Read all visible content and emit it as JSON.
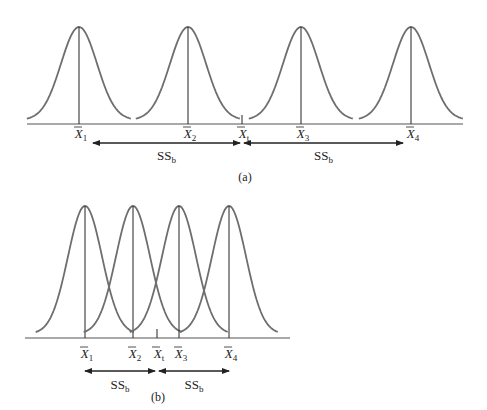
{
  "colors": {
    "curve": "#6e6e6e",
    "ink": "#222222",
    "background": "#ffffff"
  },
  "panel_a": {
    "caption": "(a)",
    "baseline_y": 124,
    "peak_y": 27,
    "x_start": 27,
    "x_end": 463,
    "sigma": 18,
    "means": [
      {
        "id": "X1",
        "symbol": "X",
        "sub": "1",
        "x": 79
      },
      {
        "id": "X2",
        "symbol": "X",
        "sub": "2",
        "x": 188
      },
      {
        "id": "X3",
        "symbol": "X",
        "sub": "3",
        "x": 301
      },
      {
        "id": "X4",
        "symbol": "X",
        "sub": "4",
        "x": 411
      }
    ],
    "grand_mean": {
      "symbol": "X",
      "sub": "t",
      "x": 242
    },
    "ss_arrows": [
      {
        "label": "SS",
        "sub": "b",
        "x1": 93,
        "x2": 240
      },
      {
        "label": "SS",
        "sub": "b",
        "x1": 244,
        "x2": 403
      }
    ]
  },
  "panel_b": {
    "caption": "(b)",
    "baseline_y": 338,
    "peak_y": 206,
    "x_start": 25,
    "x_end": 290,
    "sigma": 17,
    "means": [
      {
        "id": "X1",
        "symbol": "X",
        "sub": "1",
        "x": 85
      },
      {
        "id": "X2",
        "symbol": "X",
        "sub": "2",
        "x": 133
      },
      {
        "id": "X3",
        "symbol": "X",
        "sub": "3",
        "x": 179
      },
      {
        "id": "X4",
        "symbol": "X",
        "sub": "4",
        "x": 229
      }
    ],
    "grand_mean": {
      "symbol": "X",
      "sub": "t",
      "x": 157
    },
    "ss_arrows": [
      {
        "label": "SS",
        "sub": "b",
        "x1": 85,
        "x2": 155
      },
      {
        "label": "SS",
        "sub": "b",
        "x1": 159,
        "x2": 229
      }
    ]
  }
}
